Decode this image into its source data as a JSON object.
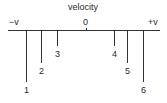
{
  "diagram": {
    "title": "velocity",
    "axis_labels": {
      "left": "−v",
      "center": "0",
      "right": "+v"
    },
    "markers": [
      {
        "label": "1",
        "x": 26,
        "length": 52
      },
      {
        "label": "2",
        "x": 41,
        "length": 33
      },
      {
        "label": "3",
        "x": 57,
        "length": 16
      },
      {
        "label": "4",
        "x": 114,
        "length": 16
      },
      {
        "label": "5",
        "x": 127,
        "length": 33
      },
      {
        "label": "6",
        "x": 143,
        "length": 52
      }
    ]
  }
}
